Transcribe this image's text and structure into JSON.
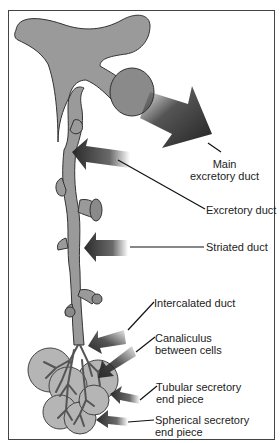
{
  "diagram": {
    "colors": {
      "duct_fill": "#9a9a9a",
      "duct_stroke": "#333333",
      "arrow_dark": "#2a2a2a",
      "acinus_fill": "#b5b5b5",
      "border": "#444444"
    },
    "labels": [
      {
        "id": "main_excretory_duct",
        "lines": [
          "Main",
          "excretory duct"
        ]
      },
      {
        "id": "excretory_duct",
        "lines": [
          "Excretory duct"
        ]
      },
      {
        "id": "striated_duct",
        "lines": [
          "Striated duct"
        ]
      },
      {
        "id": "intercalated_duct",
        "lines": [
          "Intercalated duct"
        ]
      },
      {
        "id": "canaliculus",
        "lines": [
          "Canaliculus",
          "between cells"
        ]
      },
      {
        "id": "tubular_end_piece",
        "lines": [
          "Tubular secretory",
          "end piece"
        ]
      },
      {
        "id": "spherical_end_piece",
        "lines": [
          "Spherical secretory",
          "end piece"
        ]
      }
    ]
  }
}
